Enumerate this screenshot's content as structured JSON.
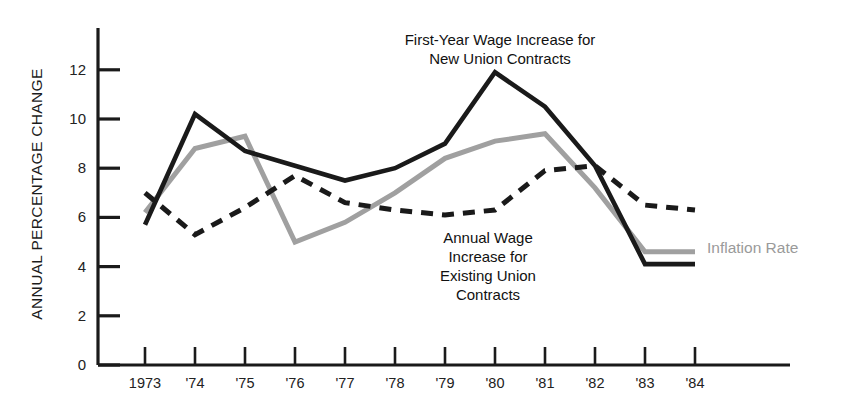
{
  "chart_data": {
    "type": "line",
    "title": "",
    "xlabel": "",
    "ylabel": "ANNUAL PERCENTAGE CHANGE",
    "categories": [
      "1973",
      "'74",
      "'75",
      "'76",
      "'77",
      "'78",
      "'79",
      "'80",
      "'81",
      "'82",
      "'83",
      "'84"
    ],
    "x_tick_labels": [
      "1973",
      "'74",
      "'75",
      "'76",
      "'77",
      "'78",
      "'79",
      "'80",
      "'81",
      "'82",
      "'83",
      "'84"
    ],
    "y_tick_labels": [
      "0",
      "2",
      "4",
      "6",
      "8",
      "10",
      "12"
    ],
    "y_ticks": [
      0,
      2,
      4,
      6,
      8,
      10,
      12
    ],
    "ylim": [
      0,
      13
    ],
    "grid": false,
    "legend_position": "inline-annotations",
    "series": [
      {
        "name": "First-Year Wage Increase for New Union Contracts",
        "style": "solid",
        "color": "#1a1a1a",
        "values": [
          5.7,
          10.2,
          8.7,
          8.1,
          7.5,
          8.0,
          9.0,
          11.9,
          10.5,
          8.1,
          4.1,
          4.1
        ]
      },
      {
        "name": "Annual Wage Increase for Existing Union Contracts",
        "style": "dashed",
        "color": "#1a1a1a",
        "values": [
          7.0,
          5.3,
          6.4,
          7.7,
          6.6,
          6.3,
          6.1,
          6.3,
          7.9,
          8.1,
          6.5,
          6.3
        ]
      },
      {
        "name": "Inflation Rate",
        "style": "solid",
        "color": "#a0a0a0",
        "values": [
          6.2,
          8.8,
          9.3,
          5.0,
          5.8,
          7.0,
          8.4,
          9.1,
          9.4,
          7.2,
          4.6,
          4.6
        ]
      }
    ],
    "annotations": [
      {
        "id": "new-contracts",
        "text": "First-Year  Wage Increase for\nNew  Union Contracts",
        "x": 500,
        "y": 30
      },
      {
        "id": "existing-contracts",
        "text": "Annual Wage\nIncrease for\nExisting Union\nContracts",
        "x": 488,
        "y": 228
      },
      {
        "id": "inflation-rate",
        "text": "Inflation Rate",
        "x": 707,
        "y": 239
      }
    ]
  },
  "axis": {
    "y_title": "ANNUAL PERCENTAGE CHANGE"
  },
  "colors": {
    "solid_black": "#1a1a1a",
    "dashed_black": "#1a1a1a",
    "gray_line": "#a0a0a0",
    "inflation_label": "#9a9a9a",
    "axis": "#1a1a1a",
    "background": "#ffffff"
  }
}
